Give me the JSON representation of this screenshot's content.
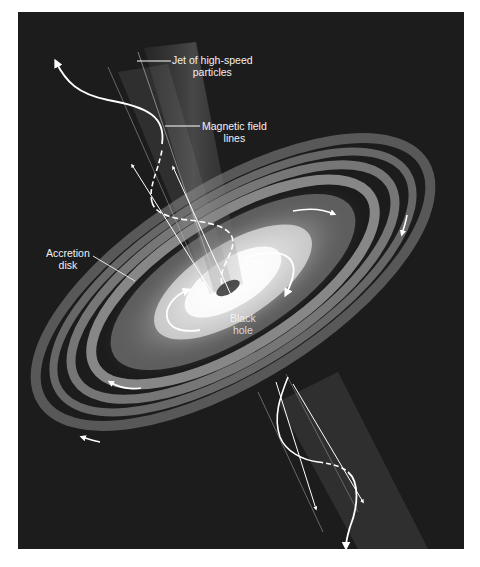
{
  "figure": {
    "background_color": "#1c1c1c",
    "line_color": "#ffffff"
  },
  "labels": {
    "jet": {
      "line1": "Jet of high-speed",
      "line2": "particles"
    },
    "magnetic": {
      "line1": "Magnetic field",
      "line2": "lines"
    },
    "accretion": {
      "line1": "Accretion",
      "line2": "disk"
    },
    "black_hole": {
      "line1": "Black",
      "line2": "hole"
    }
  },
  "icons": {
    "upper_jet": "jet-beam-upper",
    "lower_jet": "jet-beam-lower",
    "disk": "accretion-disk",
    "rotation_arrows": "rotation-arrow",
    "field_lines": "magnetic-field-line"
  }
}
